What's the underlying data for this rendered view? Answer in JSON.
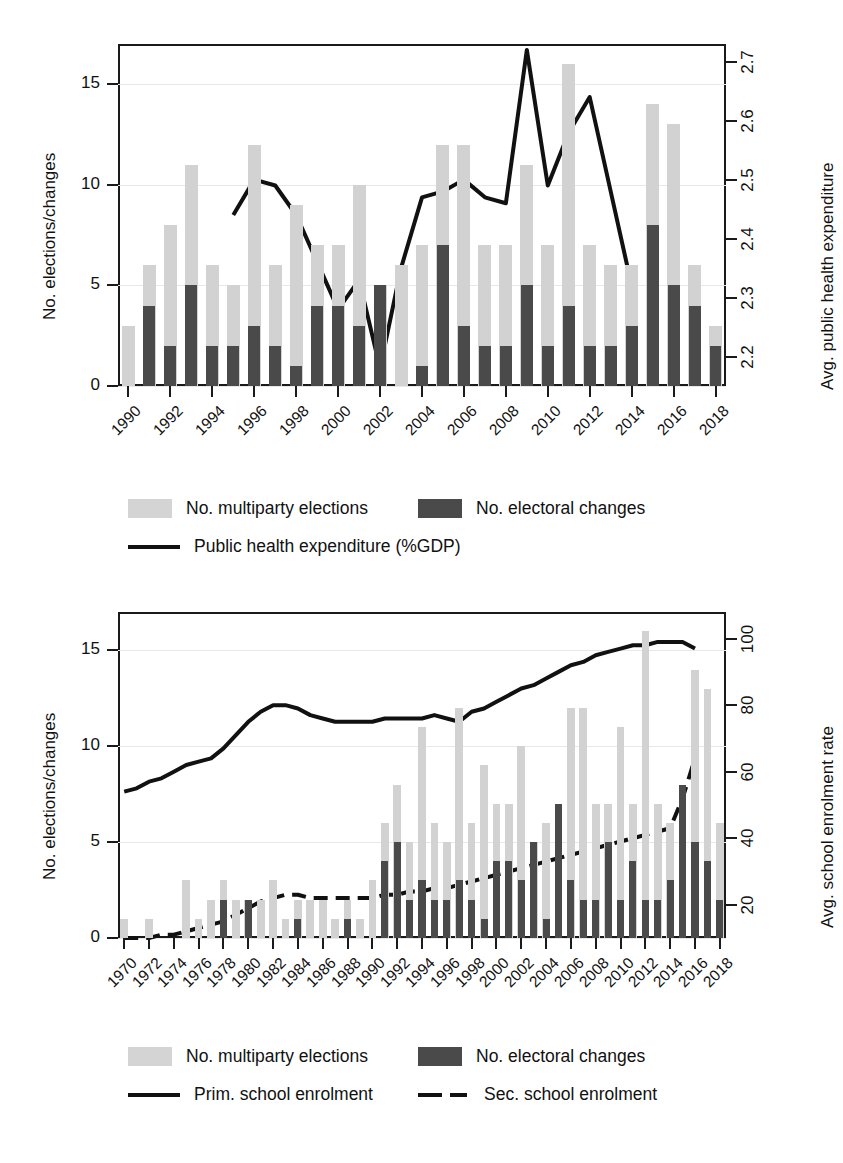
{
  "charts": [
    {
      "id": "public-health",
      "axis": {
        "ylabel_left": "No. elections/changes",
        "ylabel_right": "Avg. public health expenditure",
        "yticks_left": [
          "0",
          "5",
          "10",
          "15"
        ],
        "yticks_right": [
          "2.2",
          "2.3",
          "2.4",
          "2.5",
          "2.6",
          "2.7"
        ],
        "xticks": [
          "1990",
          "1992",
          "1994",
          "1996",
          "1998",
          "2000",
          "2002",
          "2004",
          "2006",
          "2008",
          "2010",
          "2012",
          "2014",
          "2016",
          "2018"
        ]
      },
      "legend": [
        {
          "type": "swatch-light",
          "label": "No. multiparty elections"
        },
        {
          "type": "swatch-dark",
          "label": "No. electoral changes"
        },
        {
          "type": "line-solid",
          "label": "Public health expenditure (%GDP)"
        }
      ]
    },
    {
      "id": "school-enrolment",
      "axis": {
        "ylabel_left": "No. elections/changes",
        "ylabel_right": "Avg. school enrolment rate",
        "yticks_left": [
          "0",
          "5",
          "10",
          "15"
        ],
        "yticks_right": [
          "20",
          "40",
          "60",
          "80",
          "100"
        ],
        "xticks": [
          "1970",
          "1972",
          "1974",
          "1976",
          "1978",
          "1980",
          "1982",
          "1984",
          "1986",
          "1988",
          "1990",
          "1992",
          "1994",
          "1996",
          "1998",
          "2000",
          "2002",
          "2004",
          "2006",
          "2008",
          "2010",
          "2012",
          "2014",
          "2016",
          "2018"
        ]
      },
      "legend": [
        {
          "type": "swatch-light",
          "label": "No. multiparty elections"
        },
        {
          "type": "swatch-dark",
          "label": "No. electoral changes"
        },
        {
          "type": "line-solid",
          "label": "Prim. school enrolment"
        },
        {
          "type": "line-dashed",
          "label": "Sec. school enrolment"
        }
      ]
    }
  ],
  "colors": {
    "bar_light": "#d2d2d2",
    "bar_dark": "#4a4a4a",
    "line": "#111111",
    "axis": "#1a1a1a",
    "grid": "#e8e8e8"
  },
  "chart_data": [
    {
      "type": "bar",
      "id": "public-health",
      "title": "",
      "xlabel": "",
      "ylabel": "No. elections/changes",
      "ylabel_secondary": "Avg. public health expenditure",
      "ylim": [
        0,
        17
      ],
      "ylim_secondary": [
        2.15,
        2.73
      ],
      "grid": true,
      "legend_position": "below",
      "x": [
        1990,
        1991,
        1992,
        1993,
        1994,
        1995,
        1996,
        1997,
        1998,
        1999,
        2000,
        2001,
        2002,
        2003,
        2004,
        2005,
        2006,
        2007,
        2008,
        2009,
        2010,
        2011,
        2012,
        2013,
        2014,
        2015,
        2016,
        2017,
        2018
      ],
      "series": [
        {
          "name": "No. multiparty elections",
          "kind": "bar",
          "color": "#d2d2d2",
          "axis": "left",
          "values": [
            3,
            6,
            8,
            11,
            6,
            5,
            12,
            6,
            9,
            7,
            7,
            10,
            5,
            6,
            7,
            12,
            12,
            7,
            7,
            11,
            7,
            16,
            7,
            6,
            6,
            14,
            13,
            6,
            3
          ]
        },
        {
          "name": "No. electoral changes",
          "kind": "bar",
          "color": "#4a4a4a",
          "axis": "left",
          "values": [
            0,
            4,
            2,
            5,
            2,
            2,
            3,
            2,
            1,
            4,
            4,
            3,
            5,
            0,
            1,
            7,
            3,
            2,
            2,
            5,
            2,
            4,
            2,
            2,
            3,
            8,
            5,
            4,
            2
          ]
        },
        {
          "name": "Public health expenditure (%GDP)",
          "kind": "line",
          "style": "solid",
          "color": "#111111",
          "axis": "right",
          "x": [
            1995,
            1996,
            1997,
            1998,
            1999,
            2000,
            2001,
            2002,
            2003,
            2004,
            2005,
            2006,
            2007,
            2008,
            2009,
            2010,
            2011,
            2012,
            2013,
            2014
          ],
          "values": [
            2.44,
            2.5,
            2.49,
            2.44,
            2.36,
            2.28,
            2.33,
            2.18,
            2.35,
            2.47,
            2.48,
            2.5,
            2.47,
            2.46,
            2.72,
            2.49,
            2.58,
            2.64,
            2.48,
            2.32
          ]
        }
      ]
    },
    {
      "type": "bar",
      "id": "school-enrolment",
      "title": "",
      "xlabel": "",
      "ylabel": "No. elections/changes",
      "ylabel_secondary": "Avg. school enrolment rate",
      "ylim": [
        0,
        17
      ],
      "ylim_secondary": [
        10,
        108
      ],
      "grid": true,
      "legend_position": "below",
      "x": [
        1970,
        1971,
        1972,
        1973,
        1974,
        1975,
        1976,
        1977,
        1978,
        1979,
        1980,
        1981,
        1982,
        1983,
        1984,
        1985,
        1986,
        1987,
        1988,
        1989,
        1990,
        1991,
        1992,
        1993,
        1994,
        1995,
        1996,
        1997,
        1998,
        1999,
        2000,
        2001,
        2002,
        2003,
        2004,
        2005,
        2006,
        2007,
        2008,
        2009,
        2010,
        2011,
        2012,
        2013,
        2014,
        2015,
        2016,
        2017,
        2018
      ],
      "series": [
        {
          "name": "No. multiparty elections",
          "kind": "bar",
          "color": "#d2d2d2",
          "axis": "left",
          "values": [
            1,
            0,
            1,
            0,
            0,
            3,
            1,
            2,
            3,
            2,
            2,
            2,
            3,
            1,
            2,
            2,
            2,
            1,
            2,
            1,
            3,
            6,
            8,
            5,
            11,
            6,
            5,
            12,
            6,
            9,
            7,
            7,
            10,
            5,
            6,
            7,
            12,
            12,
            7,
            7,
            11,
            7,
            16,
            7,
            6,
            6,
            14,
            13,
            6
          ]
        },
        {
          "name": "No. electoral changes",
          "kind": "bar",
          "color": "#4a4a4a",
          "axis": "left",
          "values": [
            0,
            0,
            0,
            0,
            0,
            0,
            0,
            0,
            2,
            0,
            2,
            0,
            0,
            0,
            1,
            0,
            0,
            0,
            1,
            0,
            0,
            4,
            5,
            2,
            3,
            2,
            2,
            3,
            2,
            1,
            4,
            4,
            3,
            5,
            1,
            7,
            3,
            2,
            2,
            5,
            2,
            4,
            2,
            2,
            3,
            8,
            5,
            4,
            2
          ]
        },
        {
          "name": "Prim. school enrolment",
          "kind": "line",
          "style": "solid",
          "color": "#111111",
          "axis": "right",
          "x": [
            1970,
            1971,
            1972,
            1973,
            1974,
            1975,
            1976,
            1977,
            1978,
            1979,
            1980,
            1981,
            1982,
            1983,
            1984,
            1985,
            1986,
            1987,
            1988,
            1989,
            1990,
            1991,
            1992,
            1993,
            1994,
            1995,
            1996,
            1997,
            1998,
            1999,
            2000,
            2001,
            2002,
            2003,
            2004,
            2005,
            2006,
            2007,
            2008,
            2009,
            2010,
            2011,
            2012,
            2013,
            2014,
            2015,
            2016
          ],
          "values": [
            54,
            55,
            57,
            58,
            60,
            62,
            63,
            64,
            67,
            71,
            75,
            78,
            80,
            80,
            79,
            77,
            76,
            75,
            75,
            75,
            75,
            76,
            76,
            76,
            76,
            77,
            76,
            75,
            78,
            79,
            81,
            83,
            85,
            86,
            88,
            90,
            92,
            93,
            95,
            96,
            97,
            98,
            98,
            99,
            99,
            99,
            97
          ]
        },
        {
          "name": "Sec. school enrolment",
          "kind": "line",
          "style": "dashed",
          "color": "#111111",
          "axis": "right",
          "x": [
            1970,
            1971,
            1972,
            1973,
            1974,
            1975,
            1976,
            1977,
            1978,
            1979,
            1980,
            1981,
            1982,
            1983,
            1984,
            1985,
            1986,
            1987,
            1988,
            1989,
            1990,
            1991,
            1992,
            1993,
            1994,
            1995,
            1996,
            1997,
            1998,
            1999,
            2000,
            2001,
            2002,
            2003,
            2004,
            2005,
            2006,
            2007,
            2008,
            2009,
            2010,
            2011,
            2012,
            2013,
            2014,
            2015,
            2016
          ],
          "values": [
            10,
            10,
            10,
            11,
            11,
            12,
            13,
            14,
            15,
            17,
            19,
            21,
            22,
            23,
            23,
            22,
            22,
            22,
            22,
            22,
            22,
            23,
            23,
            24,
            24,
            25,
            25,
            26,
            27,
            28,
            29,
            30,
            31,
            32,
            33,
            34,
            35,
            36,
            37,
            38,
            39,
            40,
            41,
            42,
            43,
            52,
            64
          ]
        }
      ]
    }
  ]
}
